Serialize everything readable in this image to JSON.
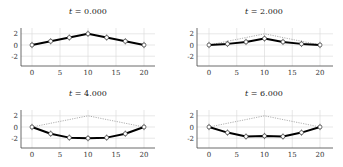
{
  "chart_data": [
    {
      "type": "line",
      "title": "t = 0.000",
      "title_var": "t",
      "title_value": "0.000",
      "xlabel": "",
      "ylabel": "",
      "xlim": [
        -2,
        22
      ],
      "ylim": [
        -3.5,
        3
      ],
      "xticks": [
        0,
        5,
        10,
        15,
        20
      ],
      "yticks": [
        2,
        0,
        -2
      ],
      "grid": true,
      "x": [
        0,
        3.333,
        6.667,
        10,
        13.333,
        16.667,
        20
      ],
      "series": [
        {
          "name": "solution",
          "values": [
            0,
            0.67,
            1.33,
            2.0,
            1.33,
            0.67,
            0
          ]
        }
      ],
      "reference": null
    },
    {
      "type": "line",
      "title": "t = 2.000",
      "title_var": "t",
      "title_value": "2.000",
      "xlabel": "",
      "ylabel": "",
      "xlim": [
        -2,
        22
      ],
      "ylim": [
        -3.5,
        3
      ],
      "xticks": [
        0,
        5,
        10,
        15,
        20
      ],
      "yticks": [
        2,
        0,
        -2
      ],
      "grid": true,
      "x": [
        0,
        3.333,
        6.667,
        10,
        13.333,
        16.667,
        20
      ],
      "series": [
        {
          "name": "solution",
          "values": [
            0,
            0.2,
            0.55,
            1.15,
            0.55,
            0.2,
            0
          ]
        }
      ],
      "reference": {
        "name": "initial",
        "values": [
          0,
          0.67,
          1.33,
          2.0,
          1.33,
          0.67,
          0
        ]
      }
    },
    {
      "type": "line",
      "title": "t = 4.000",
      "title_var": "t",
      "title_value": "4.000",
      "xlabel": "",
      "ylabel": "",
      "xlim": [
        -2,
        22
      ],
      "ylim": [
        -3.5,
        3
      ],
      "xticks": [
        0,
        5,
        10,
        15,
        20
      ],
      "yticks": [
        2,
        0,
        -2
      ],
      "grid": true,
      "x": [
        0,
        3.333,
        6.667,
        10,
        13.333,
        16.667,
        20
      ],
      "series": [
        {
          "name": "solution",
          "values": [
            0,
            -1.2,
            -1.9,
            -2.0,
            -1.9,
            -1.2,
            0
          ]
        }
      ],
      "reference": {
        "name": "initial",
        "values": [
          0,
          0.67,
          1.33,
          2.0,
          1.33,
          0.67,
          0
        ]
      }
    },
    {
      "type": "line",
      "title": "t = 6.000",
      "title_var": "t",
      "title_value": "6.000",
      "xlabel": "",
      "ylabel": "",
      "xlim": [
        -2,
        22
      ],
      "ylim": [
        -3.5,
        3
      ],
      "xticks": [
        0,
        5,
        10,
        15,
        20
      ],
      "yticks": [
        2,
        0,
        -2
      ],
      "grid": true,
      "x": [
        0,
        3.333,
        6.667,
        10,
        13.333,
        16.667,
        20
      ],
      "series": [
        {
          "name": "solution",
          "values": [
            0,
            -1.0,
            -1.7,
            -1.6,
            -1.7,
            -1.0,
            0
          ]
        }
      ],
      "reference": {
        "name": "initial",
        "values": [
          0,
          0.67,
          1.33,
          2.0,
          1.33,
          0.67,
          0
        ]
      }
    }
  ],
  "layout": {
    "panels": [
      {
        "x0px": 32,
        "x20px": 144,
        "y0px": 45,
        "spineX": 21,
        "bottom": 66,
        "top": 28,
        "right": 155,
        "titleX": 88,
        "titleY": 14,
        "tickY": 75
      },
      {
        "x0px": 209,
        "x20px": 320,
        "y0px": 45,
        "spineX": 197,
        "bottom": 66,
        "top": 28,
        "right": 333,
        "titleX": 264,
        "titleY": 14,
        "tickY": 75
      },
      {
        "x0px": 32,
        "x20px": 144,
        "y0px": 127,
        "spineX": 21,
        "bottom": 148,
        "top": 110,
        "right": 155,
        "titleX": 88,
        "titleY": 96,
        "tickY": 157
      },
      {
        "x0px": 209,
        "x20px": 320,
        "y0px": 127,
        "spineX": 197,
        "bottom": 148,
        "top": 110,
        "right": 333,
        "titleX": 264,
        "titleY": 96,
        "tickY": 157
      }
    ],
    "pxPerUnitY": 5.6,
    "errHalf": 1.6
  }
}
